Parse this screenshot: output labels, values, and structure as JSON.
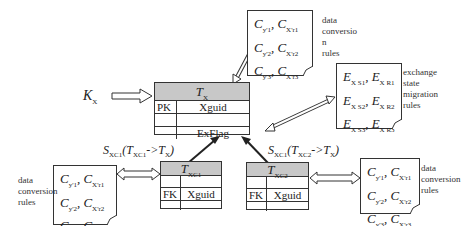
{
  "main_table": {
    "title": "T",
    "title_sub": "X",
    "rows": [
      {
        "key": "PK",
        "field": "Xguid"
      },
      {
        "key": "",
        "field": ""
      },
      {
        "key": "",
        "field": "ExFlag"
      }
    ]
  },
  "child_table_1": {
    "title": "T",
    "title_sub": "XC1",
    "rows": [
      {
        "key": "",
        "field": ""
      },
      {
        "key": "FK",
        "field": "Xguid"
      },
      {
        "key": "",
        "field": ""
      }
    ]
  },
  "child_table_2": {
    "title": "T",
    "title_sub": "XC2",
    "rows": [
      {
        "key": "",
        "field": ""
      },
      {
        "key": "FK",
        "field": "Xguid"
      },
      {
        "key": "",
        "field": ""
      }
    ]
  },
  "input_label": {
    "main": "K",
    "sub": "X"
  },
  "sync_label_1": {
    "s": "S",
    "s_sub": "XC1",
    "from": "T",
    "from_sub": "XC1",
    "arrow": "->",
    "to": "T",
    "to_sub": "X"
  },
  "sync_label_2": {
    "s": "S",
    "s_sub": "XC1",
    "from": "T",
    "from_sub": "XC2",
    "arrow": "->",
    "to": "T",
    "to_sub": "X"
  },
  "notes": {
    "top": {
      "lines": [
        {
          "a": "C",
          "a_sub": "y'1",
          "b": "C",
          "b_sub": "X'r1"
        },
        {
          "a": "C",
          "a_sub": "y'2",
          "b": "C",
          "b_sub": "X'r2"
        },
        {
          "a": "C",
          "a_sub": "y'3",
          "b": "C",
          "b_sub": "X'r3"
        }
      ],
      "label": [
        "data",
        "conversio",
        "n",
        "rules"
      ]
    },
    "right": {
      "lines": [
        {
          "a": "E",
          "a_sub": "X S1",
          "b": "E",
          "b_sub": "X R1"
        },
        {
          "a": "E",
          "a_sub": "X S2",
          "b": "E",
          "b_sub": "X R2"
        },
        {
          "a": "E",
          "a_sub": "X S3",
          "b": "E",
          "b_sub": "X R3"
        }
      ],
      "label": [
        "exchange",
        "state",
        "migration",
        "rules"
      ]
    },
    "left": {
      "lines": [
        {
          "a": "C",
          "a_sub": "y'1",
          "b": "C",
          "b_sub": "X'r1"
        },
        {
          "a": "C",
          "a_sub": "y'2",
          "b": "C",
          "b_sub": "X'r2"
        },
        {
          "a": "C",
          "a_sub": "y'3",
          "b": "C",
          "b_sub": "X'r3"
        }
      ],
      "label": [
        "data",
        "conversion",
        "rules"
      ]
    },
    "bottom_right": {
      "lines": [
        {
          "a": "C",
          "a_sub": "y'1",
          "b": "C",
          "b_sub": "X'r1"
        },
        {
          "a": "C",
          "a_sub": "y'2",
          "b": "C",
          "b_sub": "X'r2"
        },
        {
          "a": "C",
          "a_sub": "y'3",
          "b": "C",
          "b_sub": "X'r3"
        }
      ],
      "label": [
        "data",
        "conversion",
        "rules"
      ]
    }
  }
}
